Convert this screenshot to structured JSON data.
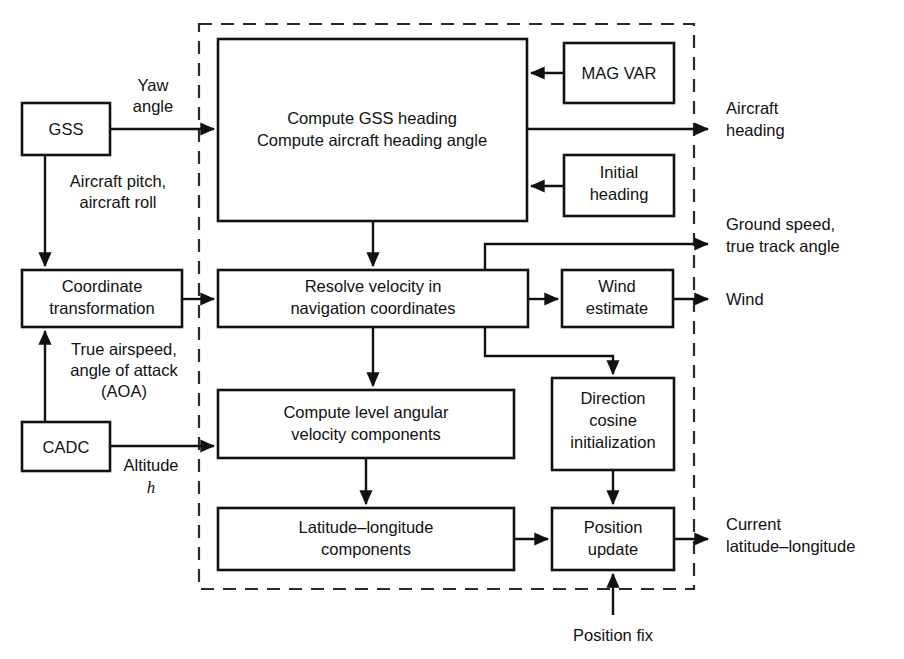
{
  "diagram": {
    "boundary_label": "navigation computer boundary (dashed)",
    "stroke_color": "#111111",
    "background_color": "#ffffff",
    "boundary_color": "#2a2a2a"
  },
  "blocks": {
    "gss": {
      "label": "GSS"
    },
    "coordinate_transformation": {
      "line1": "Coordinate",
      "line2": "transformation"
    },
    "cadc": {
      "label": "CADC"
    },
    "compute_heading": {
      "line1": "Compute GSS heading",
      "line2": "Compute aircraft heading angle"
    },
    "mag_var": {
      "label": "MAG VAR"
    },
    "initial_heading": {
      "line1": "Initial",
      "line2": "heading"
    },
    "resolve_velocity": {
      "line1": "Resolve velocity in",
      "line2": "navigation coordinates"
    },
    "wind_estimate": {
      "line1": "Wind",
      "line2": "estimate"
    },
    "compute_level_angular": {
      "line1": "Compute level angular",
      "line2": "velocity components"
    },
    "direction_cosine": {
      "line1": "Direction",
      "line2": "cosine",
      "line3": "initialization"
    },
    "latitude_longitude": {
      "line1": "Latitude–longitude",
      "line2": "components"
    },
    "position_update": {
      "line1": "Position",
      "line2": "update"
    }
  },
  "edge_labels": {
    "yaw_angle": {
      "line1": "Yaw",
      "line2": "angle"
    },
    "aircraft_attitude": {
      "line1": "Aircraft pitch,",
      "line2": "aircraft roll"
    },
    "true_airspeed": {
      "line1": "True airspeed,",
      "line2": "angle of attack",
      "line3": "(AOA)"
    },
    "altitude": {
      "line1": "Altitude",
      "symbol": "h"
    },
    "position_fix": {
      "label": "Position fix"
    }
  },
  "outputs": {
    "aircraft_heading": {
      "line1": "Aircraft",
      "line2": "heading"
    },
    "ground_speed": {
      "line1": "Ground speed,",
      "line2": "true track angle"
    },
    "wind": {
      "line1": "Wind"
    },
    "current_lat_long": {
      "line1": "Current",
      "line2": "latitude–longitude"
    }
  }
}
